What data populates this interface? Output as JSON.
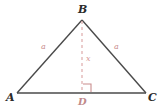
{
  "figure": {
    "type": "geometry-diagram",
    "background_color": "#ffffff",
    "stroke_color": "#4a4a4a",
    "accent_color": "#c98d8d",
    "vertices": {
      "A": {
        "label": "A",
        "x": 17,
        "y": 93
      },
      "B": {
        "label": "B",
        "x": 82,
        "y": 20
      },
      "C": {
        "label": "C",
        "x": 146,
        "y": 93
      },
      "D": {
        "label": "D",
        "x": 82,
        "y": 93
      }
    },
    "sides": {
      "left_leg_label": "a",
      "right_leg_label": "a",
      "altitude_label": "x"
    },
    "markers": {
      "right_angle": "right-angle-square",
      "altitude_style": "dashed"
    }
  }
}
